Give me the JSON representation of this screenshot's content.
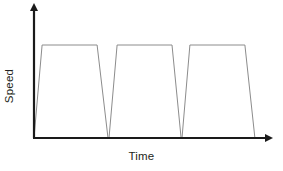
{
  "figure": {
    "background_color": "#ffffff",
    "width": 283,
    "height": 171
  },
  "axes": {
    "y_label": "Speed",
    "x_label": "Time",
    "axis_color": "#1a1a1a",
    "origin_x": 34,
    "origin_y": 138,
    "x_axis_end": 272,
    "y_axis_top": 5
  },
  "trace": {
    "line_color": "#8c8c8c",
    "line_width": 1
  },
  "chart_data": {
    "type": "line",
    "title": "",
    "xlabel": "Time",
    "ylabel": "Speed",
    "xlim": [
      0,
      1
    ],
    "ylim": [
      0,
      1
    ],
    "grid": false,
    "legend": null,
    "axis_ticks": {
      "x": [],
      "y": []
    },
    "series": [
      {
        "name": "Speed",
        "x": [
          0.0,
          0.034,
          0.265,
          0.311,
          0.315,
          0.349,
          0.58,
          0.618,
          0.622,
          0.655,
          0.886,
          0.928
        ],
        "y": [
          0.0,
          1.0,
          1.0,
          0.0,
          0.0,
          1.0,
          1.0,
          0.0,
          0.0,
          1.0,
          1.0,
          0.0
        ]
      }
    ],
    "cycles": [
      {
        "index": 1,
        "phase_labels": [
          "acceleration",
          "constant speed",
          "deceleration"
        ],
        "start_x": 0.0,
        "ramp_up_end_x": 0.034,
        "plateau_end_x": 0.265,
        "end_x": 0.311,
        "plateau_y": 1.0
      },
      {
        "index": 2,
        "phase_labels": [
          "acceleration",
          "constant speed",
          "deceleration"
        ],
        "start_x": 0.315,
        "ramp_up_end_x": 0.349,
        "plateau_end_x": 0.58,
        "end_x": 0.618,
        "plateau_y": 1.0
      },
      {
        "index": 3,
        "phase_labels": [
          "acceleration",
          "constant speed",
          "deceleration"
        ],
        "start_x": 0.622,
        "ramp_up_end_x": 0.655,
        "plateau_end_x": 0.886,
        "end_x": 0.928,
        "plateau_y": 1.0
      }
    ]
  }
}
